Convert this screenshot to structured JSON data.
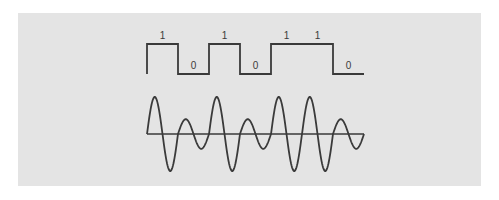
{
  "diagram": {
    "digital_signal": {
      "bits": [
        "1",
        "0",
        "1",
        "0",
        "1",
        "1",
        "0"
      ]
    },
    "analog_signal": {
      "modulation": "amplitude",
      "cycles_per_bit": 1,
      "amplitude_for_bit": {
        "1": 1.0,
        "0": 0.4
      }
    },
    "colors": {
      "background": "#e4e4e4",
      "line": "#3a3a3a"
    }
  }
}
